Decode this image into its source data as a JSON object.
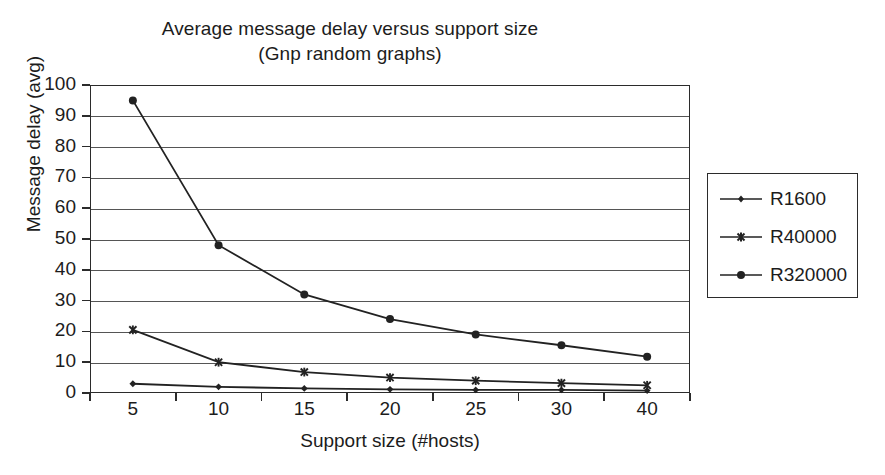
{
  "chart_data": {
    "type": "line",
    "title": "Average message delay versus support size",
    "subtitle": "(Gnp random graphs)",
    "xlabel": "Support size (#hosts)",
    "ylabel": "Message delay (avg)",
    "categories": [
      "5",
      "10",
      "15",
      "20",
      "25",
      "30",
      "40"
    ],
    "ylim": [
      0,
      100
    ],
    "ytick_step": 10,
    "yticks": [
      "100",
      "90",
      "80",
      "70",
      "60",
      "50",
      "40",
      "30",
      "20",
      "10",
      "0"
    ],
    "grid": true,
    "grid_axis": "y",
    "legend_position": "right",
    "series": [
      {
        "name": "R1600",
        "marker": "diamond",
        "color": "#222222",
        "values": [
          3,
          2,
          1.5,
          1.2,
          1,
          1,
          0.8
        ]
      },
      {
        "name": "R40000",
        "marker": "asterisk",
        "color": "#222222",
        "values": [
          20.5,
          10,
          6.8,
          5,
          4,
          3.2,
          2.5
        ]
      },
      {
        "name": "R320000",
        "marker": "circle",
        "color": "#222222",
        "values": [
          95,
          48,
          32,
          24,
          19,
          15.5,
          11.8
        ]
      }
    ]
  },
  "colors": {
    "background": "#ffffff",
    "axis": "#2b2b2b",
    "grid": "#555555",
    "text": "#1c1c1c"
  }
}
